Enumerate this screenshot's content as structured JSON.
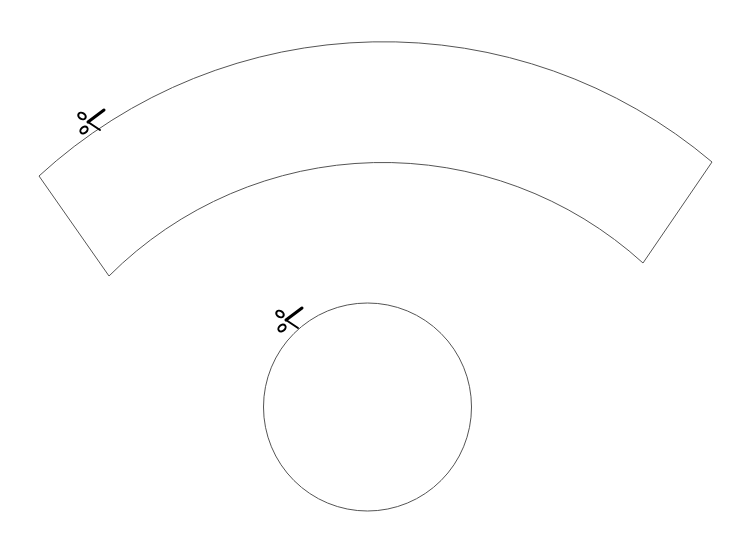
{
  "template": {
    "stroke_color": "#555555",
    "icon_color": "#000000",
    "cone_net": {
      "shape": "annular-sector",
      "center": [
        385,
        550
      ],
      "outer_radius": 509,
      "inner_radius": 387,
      "corners": {
        "outer_left": [
          39,
          176
        ],
        "inner_left": [
          109,
          276
        ],
        "outer_right": [
          712,
          162
        ],
        "inner_right": [
          643,
          263
        ]
      },
      "cut_marker_icon": "scissors-icon"
    },
    "base_circle": {
      "shape": "circle",
      "center": [
        367.5,
        407
      ],
      "radius": 104,
      "cut_marker_icon": "scissors-icon"
    }
  }
}
